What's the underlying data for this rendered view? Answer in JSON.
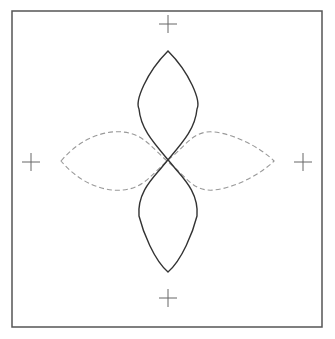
{
  "diagram": {
    "frame": {
      "x": 12,
      "y": 11,
      "width": 310,
      "height": 316,
      "stroke": "#555555"
    },
    "center": {
      "x": 168,
      "y": 161
    },
    "registration_marks": [
      {
        "name": "top",
        "x": 168,
        "y": 24
      },
      {
        "name": "bottom",
        "x": 168,
        "y": 298
      },
      {
        "name": "left",
        "x": 31,
        "y": 162
      },
      {
        "name": "right",
        "x": 303,
        "y": 162
      }
    ],
    "solid_curve": {
      "style": "solid",
      "color": "#333333",
      "orientation": "vertical",
      "top_tip": {
        "x": 168,
        "y": 51
      },
      "bottom_tip": {
        "x": 168,
        "y": 272
      },
      "half_width": 29
    },
    "dashed_curve": {
      "style": "dashed",
      "color": "#999999",
      "orientation": "horizontal",
      "left_tip": {
        "x": 61,
        "y": 161
      },
      "right_tip": {
        "x": 274,
        "y": 161
      },
      "half_height": 29
    }
  }
}
